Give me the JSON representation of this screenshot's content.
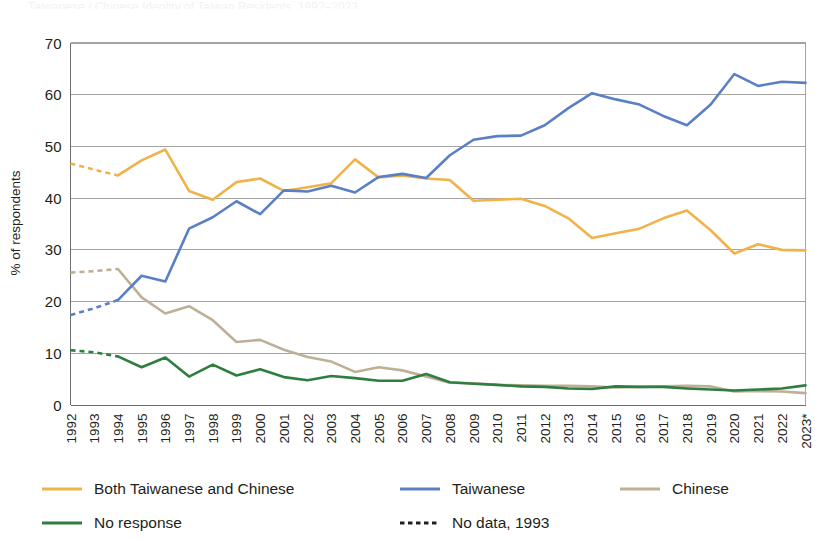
{
  "page": {
    "title_fragment": "Taiwanese / Chinese Identity of Taiwan Residents, 1992–2023"
  },
  "axes": {
    "ylabel": "% of respondents",
    "yticks": [
      "0",
      "10",
      "20",
      "30",
      "40",
      "50",
      "60",
      "70"
    ],
    "ylim": [
      0,
      70
    ],
    "xticks": [
      "1992",
      "1993",
      "1994",
      "1995",
      "1996",
      "1997",
      "1998",
      "1999",
      "2000",
      "2001",
      "2002",
      "2003",
      "2004",
      "2005",
      "2006",
      "2007",
      "2008",
      "2009",
      "2010",
      "2011",
      "2012",
      "2013",
      "2014",
      "2015",
      "2016",
      "2017",
      "2018",
      "2019",
      "2020",
      "2021",
      "2022",
      "2023*"
    ]
  },
  "colors": {
    "both": "#f0b34a",
    "taiwanese": "#5b7fc4",
    "chinese": "#bdb096",
    "no_response": "#2e7d41",
    "no_data": "#231f20",
    "grid": "#9a9a9a",
    "axis": "#6f6f6f",
    "text": "#231f20"
  },
  "legend": {
    "items": [
      {
        "label": "Both Taiwanese and Chinese",
        "color_key": "both",
        "style": "solid"
      },
      {
        "label": "Taiwanese",
        "color_key": "taiwanese",
        "style": "solid"
      },
      {
        "label": "Chinese",
        "color_key": "chinese",
        "style": "solid"
      },
      {
        "label": "No response",
        "color_key": "no_response",
        "style": "solid"
      },
      {
        "label": "No data, 1993",
        "color_key": "no_data",
        "style": "dashed"
      }
    ]
  },
  "footnote": {
    "marker": "*",
    "note_on_axis": "2023*"
  },
  "chart_data": {
    "type": "line",
    "title": "Taiwanese / Chinese Identity of Taiwan Residents, 1992–2023",
    "xlabel": "",
    "ylabel": "% of respondents",
    "ylim": [
      0,
      70
    ],
    "ytick_step": 10,
    "grid": true,
    "legend_position": "bottom-left",
    "x": [
      "1992",
      "1993",
      "1994",
      "1995",
      "1996",
      "1997",
      "1998",
      "1999",
      "2000",
      "2001",
      "2002",
      "2003",
      "2004",
      "2005",
      "2006",
      "2007",
      "2008",
      "2009",
      "2010",
      "2011",
      "2012",
      "2013",
      "2014",
      "2015",
      "2016",
      "2017",
      "2018",
      "2019",
      "2020",
      "2021",
      "2022",
      "2023*"
    ],
    "interpolated_range": {
      "from": "1992",
      "to": "1994",
      "reason": "No data, 1993"
    },
    "series": [
      {
        "name": "Both Taiwanese and Chinese",
        "color": "#f0b34a",
        "values": [
          46.6,
          45.4,
          44.3,
          47.2,
          49.3,
          41.3,
          39.6,
          43.0,
          43.7,
          41.3,
          42.0,
          42.8,
          47.4,
          43.9,
          44.3,
          43.7,
          43.4,
          39.4,
          39.6,
          39.8,
          38.4,
          36.0,
          32.2,
          33.1,
          34.0,
          36.0,
          37.5,
          33.7,
          29.2,
          31.0,
          29.9,
          29.8
        ]
      },
      {
        "name": "Taiwanese",
        "color": "#5b7fc4",
        "values": [
          17.3,
          18.6,
          20.2,
          24.9,
          23.8,
          34.0,
          36.2,
          39.3,
          36.8,
          41.4,
          41.2,
          42.3,
          41.0,
          44.0,
          44.6,
          43.8,
          48.2,
          51.2,
          51.9,
          52.0,
          54.0,
          57.3,
          60.2,
          59.0,
          58.0,
          55.8,
          54.0,
          58.0,
          63.9,
          61.6,
          62.4,
          62.2
        ]
      },
      {
        "name": "Chinese",
        "color": "#bdb096",
        "values": [
          25.5,
          25.8,
          26.2,
          20.7,
          17.6,
          19.0,
          16.3,
          12.1,
          12.5,
          10.6,
          9.2,
          8.3,
          6.3,
          7.2,
          6.6,
          5.4,
          4.2,
          4.1,
          3.8,
          3.7,
          3.6,
          3.6,
          3.5,
          3.3,
          3.4,
          3.5,
          3.6,
          3.5,
          2.5,
          2.6,
          2.5,
          2.2
        ]
      },
      {
        "name": "No response",
        "color": "#2e7d41",
        "values": [
          10.5,
          10.1,
          9.3,
          7.2,
          9.1,
          5.4,
          7.7,
          5.6,
          6.8,
          5.3,
          4.7,
          5.5,
          5.1,
          4.6,
          4.6,
          5.9,
          4.3,
          4.0,
          3.8,
          3.5,
          3.4,
          3.1,
          3.0,
          3.5,
          3.4,
          3.4,
          3.1,
          2.9,
          2.7,
          2.9,
          3.1,
          3.7
        ]
      }
    ]
  }
}
